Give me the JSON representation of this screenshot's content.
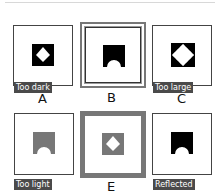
{
  "options": [
    {
      "letter": "A",
      "tag": "Too dark",
      "frame": "plain"
    },
    {
      "letter": "B",
      "tag": "",
      "frame": "double"
    },
    {
      "letter": "C",
      "tag": "Too large",
      "frame": "plain"
    },
    {
      "letter": "D",
      "tag": "Too light",
      "frame": "plain"
    },
    {
      "letter": "E",
      "tag": "",
      "frame": "thick"
    },
    {
      "letter": "F",
      "tag": "Reflected",
      "frame": "plain"
    }
  ],
  "colors": {
    "dark": "#000000",
    "grey": "#777777",
    "tag_bg": "#4a4a4a"
  }
}
